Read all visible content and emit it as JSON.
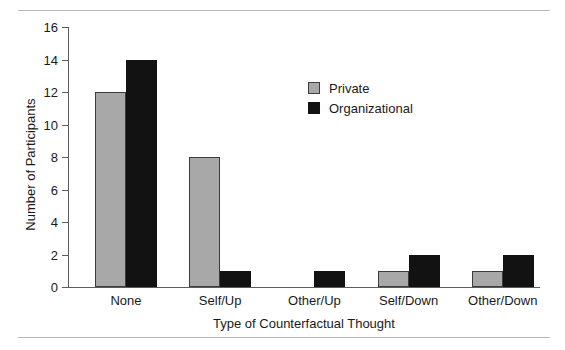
{
  "chart_data": {
    "type": "bar",
    "title": "",
    "xlabel": "Type of Counterfactual Thought",
    "ylabel": "Number of Participants",
    "categories": [
      "None",
      "Self/Up",
      "Other/Up",
      "Self/Down",
      "Other/Down"
    ],
    "series": [
      {
        "name": "Private",
        "color": "#a8a8a8",
        "values": [
          12,
          8,
          0,
          1,
          1
        ]
      },
      {
        "name": "Organizational",
        "color": "#121212",
        "values": [
          14,
          1,
          1,
          2,
          2
        ]
      }
    ],
    "ylim": [
      0,
      16
    ],
    "ytick_step": 2,
    "yticks": [
      0,
      2,
      4,
      6,
      8,
      10,
      12,
      14,
      16
    ],
    "ytick_labels": [
      "0",
      "2",
      "4",
      "6",
      "8",
      "10",
      "12",
      "14",
      "16"
    ],
    "grid": false,
    "legend_position": "upper-center-right",
    "legend_entries": [
      "Private",
      "Organizational"
    ]
  },
  "figure": {
    "axis_color": "#5d5d5d",
    "rule_color": "#b9b9b9",
    "background": "#ffffff"
  }
}
